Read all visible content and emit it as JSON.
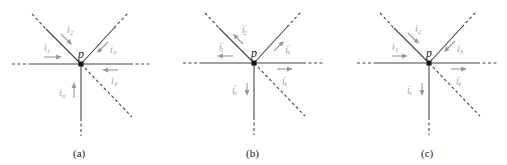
{
  "figure": {
    "node_label": "p",
    "panels": [
      {
        "id": "a",
        "caption": "(a)",
        "node": {
          "x": 81,
          "y": 64
        },
        "currents": [
          {
            "name": "i1",
            "text": "i",
            "sub": "1",
            "prime": "",
            "direction": "into-node",
            "branch": "left"
          },
          {
            "name": "i2",
            "text": "i",
            "sub": "2",
            "prime": "",
            "direction": "into-node",
            "branch": "upper-left"
          },
          {
            "name": "i3",
            "text": "i",
            "sub": "3",
            "prime": "",
            "direction": "into-node",
            "branch": "upper-right"
          },
          {
            "name": "i4",
            "text": "i",
            "sub": "4",
            "prime": "",
            "direction": "into-node",
            "branch": "right"
          },
          {
            "name": "in",
            "text": "i",
            "sub": "n",
            "prime": "",
            "direction": "into-node",
            "branch": "down"
          }
        ]
      },
      {
        "id": "b",
        "caption": "(b)",
        "node": {
          "x": 254,
          "y": 63
        },
        "currents": [
          {
            "name": "i1-prime",
            "text": "i",
            "sub": "1",
            "prime": "′",
            "direction": "out-of-node",
            "branch": "left"
          },
          {
            "name": "i2-prime",
            "text": "i",
            "sub": "2",
            "prime": "′",
            "direction": "out-of-node",
            "branch": "upper-left"
          },
          {
            "name": "i3-prime",
            "text": "i",
            "sub": "3",
            "prime": "′",
            "direction": "out-of-node",
            "branch": "upper-right"
          },
          {
            "name": "i4-prime",
            "text": "i",
            "sub": "4",
            "prime": "′",
            "direction": "out-of-node",
            "branch": "right"
          },
          {
            "name": "in-prime",
            "text": "i",
            "sub": "n",
            "prime": "′",
            "direction": "out-of-node",
            "branch": "down"
          }
        ]
      },
      {
        "id": "c",
        "caption": "(c)",
        "node": {
          "x": 429,
          "y": 63
        },
        "currents": [
          {
            "name": "i1",
            "text": "i",
            "sub": "1",
            "prime": "",
            "direction": "into-node",
            "branch": "left"
          },
          {
            "name": "i2",
            "text": "i",
            "sub": "2",
            "prime": "",
            "direction": "into-node",
            "branch": "upper-left"
          },
          {
            "name": "i3",
            "text": "i",
            "sub": "3",
            "prime": "",
            "direction": "into-node",
            "branch": "upper-right"
          },
          {
            "name": "i4-prime",
            "text": "i",
            "sub": "4",
            "prime": "′",
            "direction": "out-of-node",
            "branch": "right"
          },
          {
            "name": "in-prime",
            "text": "i",
            "sub": "n",
            "prime": "′",
            "direction": "out-of-node",
            "branch": "down"
          }
        ]
      }
    ]
  },
  "colors": {
    "wire": "#444444",
    "arrow": "#9a9a9a",
    "node": "#111111"
  }
}
